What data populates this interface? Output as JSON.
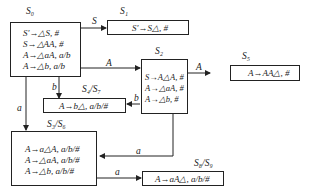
{
  "states": {
    "s0": {
      "name": "S₀",
      "rules": [
        "S′→△S, #",
        "S→△AA, #",
        "A→△aA, a/b",
        "A→△b, a/b"
      ]
    },
    "s1": {
      "name": "S₁",
      "rules": [
        "S′→S△, #"
      ]
    },
    "s2": {
      "name": "S₂",
      "rules": [
        "S→A△A, #",
        "A→△aA, #",
        "A→△b, #"
      ]
    },
    "s5": {
      "name": "S₅",
      "rules": [
        "A→AA△, #"
      ]
    },
    "s47": {
      "name": "S₄/S₇",
      "rules": [
        "A→b△, a/b/#"
      ]
    },
    "s36": {
      "name": "S₃/S₆",
      "rules": [
        "A→a△A, a/b/#",
        "A→△aA, a/b/#",
        "A→△b, a/b/#"
      ]
    },
    "s89": {
      "name": "S₈/S₉",
      "rules": [
        "A→aA△, a/b/#"
      ]
    }
  },
  "transitions": [
    {
      "from": "S0",
      "to": "S1",
      "label": "S"
    },
    {
      "from": "S0",
      "to": "S2",
      "label": "A"
    },
    {
      "from": "S0",
      "to": "S4/S7",
      "label": "b"
    },
    {
      "from": "S0",
      "to": "S3/S6",
      "label": "a"
    },
    {
      "from": "S2",
      "to": "S5",
      "label": "A"
    },
    {
      "from": "S2",
      "to": "S4/S7",
      "label": "b"
    },
    {
      "from": "S2",
      "to": "S3/S6",
      "label": "a"
    },
    {
      "from": "S3/S6",
      "to": "S8/S9",
      "label": "a"
    }
  ],
  "edge_labels": {
    "s": "S",
    "a1": "A",
    "b1": "b",
    "a_left": "a",
    "a2": "A",
    "b2": "b",
    "a3": "a",
    "a4": "a"
  }
}
